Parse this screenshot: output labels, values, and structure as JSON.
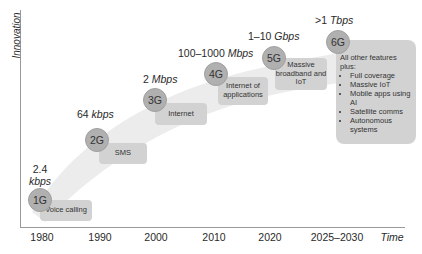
{
  "axes": {
    "y_label": "Innovation",
    "x_label": "Time",
    "x_ticks": [
      "1980",
      "1990",
      "2000",
      "2010",
      "2020",
      "2025–2030"
    ]
  },
  "generations": [
    {
      "name": "1G",
      "speed_value": "2.4",
      "speed_unit": "kbps",
      "feature": "Voice calling"
    },
    {
      "name": "2G",
      "speed_value": "64",
      "speed_unit": "kbps",
      "feature": "SMS"
    },
    {
      "name": "3G",
      "speed_value": "2",
      "speed_unit": "Mbps",
      "feature": "Internet"
    },
    {
      "name": "4G",
      "speed_value": "100–1000",
      "speed_unit": "Mbps",
      "feature": "Internet of applications"
    },
    {
      "name": "5G",
      "speed_value": "1–10",
      "speed_unit": "Gbps",
      "feature": "Massive broadband and IoT"
    },
    {
      "name": "6G",
      "speed_value": ">1",
      "speed_unit": "Tbps",
      "feature_intro": "All other features plus:",
      "features": [
        "Full coverage",
        "Massive IoT",
        "Mobile apps using AI",
        "Satellite comms",
        "Autonomous systems"
      ]
    }
  ],
  "colors": {
    "circle": "#b0b0b0",
    "box": "#d2d2d2",
    "band": "#ececec",
    "axis": "#9a9a9a"
  }
}
